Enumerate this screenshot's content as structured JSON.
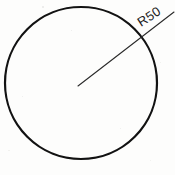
{
  "drawing": {
    "title": "Circle with radius dimension",
    "background_color": "#fdfdfc",
    "ink_color": "#121212",
    "leader_color": "#2a2a2a",
    "dimension_label": "R50",
    "label_rotation_deg": -33,
    "annotations": {
      "radius_value": "50",
      "radius_prefix": "R"
    }
  },
  "chart_data": {
    "type": "diagram",
    "shapes": [
      {
        "name": "circle",
        "kind": "circle",
        "cx": 81,
        "cy": 83,
        "r": 76,
        "stroke": "#121212",
        "stroke_width": 2.2,
        "fill": "none"
      },
      {
        "name": "radius-leader-line",
        "kind": "line",
        "x1": 78,
        "y1": 86,
        "x2": 174,
        "y2": 12,
        "stroke": "#2a2a2a",
        "stroke_width": 1.1
      }
    ],
    "labels": [
      {
        "name": "radius-label",
        "text": "R50",
        "x": 141,
        "y": 27,
        "rotation": -33,
        "font_size": 13
      }
    ]
  }
}
